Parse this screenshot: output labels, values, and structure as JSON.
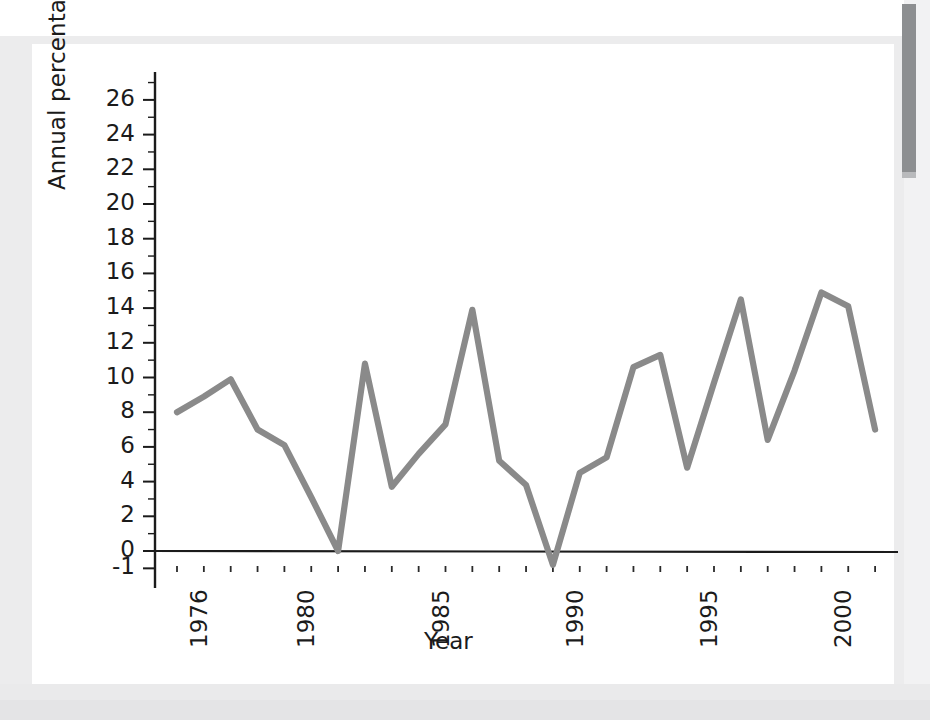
{
  "chart_data": {
    "type": "line",
    "title": "",
    "xlabel": "Year",
    "ylabel": "Annual percentage change",
    "xlim": [
      1975.5,
      2002.5
    ],
    "ylim": [
      -1,
      27
    ],
    "grid": false,
    "legend": "none",
    "line_color": "#8a8a8a",
    "axis_color": "#1b1b1b",
    "y_ticks": [
      -1,
      0,
      2,
      4,
      6,
      8,
      10,
      12,
      14,
      16,
      18,
      20,
      22,
      24,
      26
    ],
    "y_tick_labels": [
      "-1",
      "0",
      "2",
      "4",
      "6",
      "8",
      "10",
      "12",
      "14",
      "16",
      "18",
      "20",
      "22",
      "24",
      "26"
    ],
    "x_ticks": [
      1976,
      1977,
      1978,
      1979,
      1980,
      1981,
      1982,
      1983,
      1984,
      1985,
      1986,
      1987,
      1988,
      1989,
      1990,
      1991,
      1992,
      1993,
      1994,
      1995,
      1996,
      1997,
      1998,
      1999,
      2000,
      2001,
      2002
    ],
    "x_tick_labels": [
      "1976",
      "",
      "",
      "",
      "1980",
      "",
      "",
      "",
      "",
      "1985",
      "",
      "",
      "",
      "",
      "1990",
      "",
      "",
      "",
      "",
      "1995",
      "",
      "",
      "",
      "",
      "2000",
      "",
      ""
    ],
    "x": [
      1976,
      1977,
      1978,
      1979,
      1980,
      1981,
      1982,
      1983,
      1984,
      1985,
      1986,
      1987,
      1988,
      1989,
      1990,
      1991,
      1992,
      1993,
      1994,
      1995,
      1996,
      1997,
      1998,
      1999,
      2000,
      2001,
      2002
    ],
    "values": [
      8.0,
      8.9,
      9.9,
      7.0,
      6.1,
      3.1,
      0.0,
      10.8,
      3.7,
      5.6,
      7.3,
      13.9,
      5.2,
      3.8,
      -0.8,
      4.5,
      5.4,
      10.6,
      11.3,
      4.8,
      9.7,
      14.5,
      6.4,
      10.4,
      14.9,
      14.1,
      7.0
    ]
  },
  "axes": {
    "y_title": "Annual percentage change",
    "x_title": "Year"
  }
}
